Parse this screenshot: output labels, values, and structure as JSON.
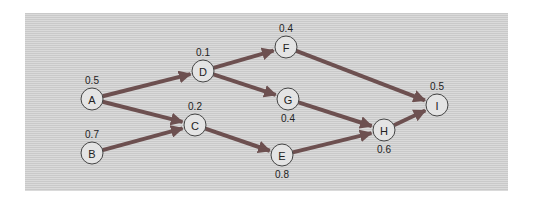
{
  "diagram": {
    "type": "activity-network",
    "edge_color": "#6d5050",
    "node_fill": "#e4e4e4",
    "nodes": [
      {
        "id": "A",
        "label": "A",
        "value": "0.5",
        "x": 92,
        "y": 99,
        "value_pos": "above"
      },
      {
        "id": "B",
        "label": "B",
        "value": "0.7",
        "x": 92,
        "y": 153,
        "value_pos": "above"
      },
      {
        "id": "C",
        "label": "C",
        "value": "0.2",
        "x": 195,
        "y": 125,
        "value_pos": "above"
      },
      {
        "id": "D",
        "label": "D",
        "value": "0.1",
        "x": 203,
        "y": 71,
        "value_pos": "above"
      },
      {
        "id": "E",
        "label": "E",
        "value": "0.8",
        "x": 282,
        "y": 155,
        "value_pos": "below"
      },
      {
        "id": "F",
        "label": "F",
        "value": "0.4",
        "x": 286,
        "y": 47,
        "value_pos": "above"
      },
      {
        "id": "G",
        "label": "G",
        "value": "0.4",
        "x": 288,
        "y": 99,
        "value_pos": "below"
      },
      {
        "id": "H",
        "label": "H",
        "value": "0.6",
        "x": 384,
        "y": 130,
        "value_pos": "below"
      },
      {
        "id": "I",
        "label": "I",
        "value": "0.5",
        "x": 437,
        "y": 105,
        "value_pos": "above"
      }
    ],
    "edges": [
      {
        "from": "A",
        "to": "D"
      },
      {
        "from": "A",
        "to": "C"
      },
      {
        "from": "B",
        "to": "C"
      },
      {
        "from": "D",
        "to": "F"
      },
      {
        "from": "D",
        "to": "G"
      },
      {
        "from": "C",
        "to": "E"
      },
      {
        "from": "F",
        "to": "I"
      },
      {
        "from": "G",
        "to": "H"
      },
      {
        "from": "E",
        "to": "H"
      },
      {
        "from": "H",
        "to": "I"
      }
    ]
  }
}
